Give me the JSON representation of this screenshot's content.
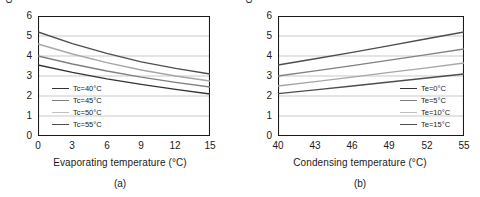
{
  "figure": {
    "background": "#ffffff",
    "axis_color": "#1a1a1a",
    "grid_color": "#c9c9c9"
  },
  "chart_data": [
    {
      "type": "line",
      "panel": "a",
      "caption": "(a)",
      "title": "",
      "xlabel": "Evaporating temperature (°C)",
      "ylabel": "Compression ratio",
      "xlim": [
        0,
        15
      ],
      "ylim": [
        0,
        6
      ],
      "xticks": [
        0,
        3,
        6,
        9,
        12,
        15
      ],
      "yticks": [
        0,
        1,
        2,
        3,
        4,
        5,
        6
      ],
      "grid": "horizontal",
      "legend_position": "lower-left",
      "x": [
        0,
        3,
        6,
        9,
        12,
        15
      ],
      "series": [
        {
          "name": "Tc=55°C",
          "label": "Tc=55°C",
          "color": "#4d4d4d",
          "values": [
            5.2,
            4.62,
            4.13,
            3.71,
            3.38,
            3.1
          ]
        },
        {
          "name": "Tc=50°C",
          "label": "Tc=50°C",
          "color": "#a6a6a6",
          "values": [
            4.6,
            4.1,
            3.67,
            3.3,
            3.0,
            2.75
          ]
        },
        {
          "name": "Tc=45°C",
          "label": "Tc=45°C",
          "color": "#808080",
          "values": [
            4.0,
            3.6,
            3.25,
            2.94,
            2.68,
            2.45
          ]
        },
        {
          "name": "Tc=40°C",
          "label": "Tc=40°C",
          "color": "#333333",
          "values": [
            3.55,
            3.18,
            2.86,
            2.58,
            2.33,
            2.1
          ]
        }
      ],
      "legend": [
        {
          "label": "Tc=40°C",
          "color": "#333333"
        },
        {
          "label": "Tc=45°C",
          "color": "#808080"
        },
        {
          "label": "Tc=50°C",
          "color": "#c0c0c0"
        },
        {
          "label": "Tc=55°C",
          "color": "#4d4d4d"
        }
      ]
    },
    {
      "type": "line",
      "panel": "b",
      "caption": "(b)",
      "title": "",
      "xlabel": "Condensing temperature (°C)",
      "ylabel": "Compression ratio",
      "xlim": [
        40,
        55
      ],
      "ylim": [
        0,
        6
      ],
      "xticks": [
        40,
        43,
        46,
        49,
        52,
        55
      ],
      "yticks": [
        0,
        1,
        2,
        3,
        4,
        5,
        6
      ],
      "grid": "horizontal",
      "legend_position": "lower-right",
      "x": [
        40,
        43,
        46,
        49,
        52,
        55
      ],
      "series": [
        {
          "name": "Te=0°C",
          "label": "Te=0°C",
          "color": "#4d4d4d",
          "values": [
            3.55,
            3.86,
            4.18,
            4.52,
            4.86,
            5.2
          ]
        },
        {
          "name": "Te=5°C",
          "label": "Te=5°C",
          "color": "#808080",
          "values": [
            3.0,
            3.26,
            3.52,
            3.79,
            4.07,
            4.35
          ]
        },
        {
          "name": "Te=10°C",
          "label": "Te=10°C",
          "color": "#a6a6a6",
          "values": [
            2.5,
            2.72,
            2.94,
            3.18,
            3.41,
            3.65
          ]
        },
        {
          "name": "Te=15°C",
          "label": "Te=15°C",
          "color": "#4d4d4d",
          "values": [
            2.12,
            2.31,
            2.5,
            2.7,
            2.9,
            3.1
          ]
        }
      ],
      "legend": [
        {
          "label": "Te=0°C",
          "color": "#333333"
        },
        {
          "label": "Te=5°C",
          "color": "#808080"
        },
        {
          "label": "Te=10°C",
          "color": "#c0c0c0"
        },
        {
          "label": "Te=15°C",
          "color": "#4d4d4d"
        }
      ]
    }
  ]
}
